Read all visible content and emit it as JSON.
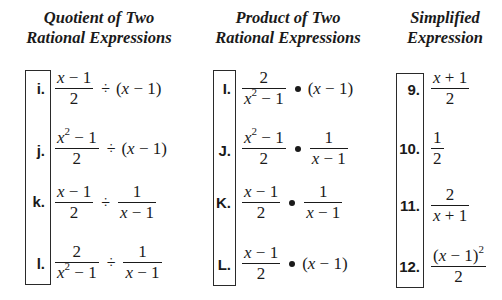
{
  "columns": [
    {
      "heading_line1": "Quotient of Two",
      "heading_line2": "Rational Expressions",
      "items": [
        {
          "label": "i.",
          "expr": "(x − 1)/2 ÷ (x − 1)"
        },
        {
          "label": "j.",
          "expr": "(x² − 1)/2 ÷ (x − 1)"
        },
        {
          "label": "k.",
          "expr": "(x − 1)/2 ÷ 1/(x − 1)"
        },
        {
          "label": "l.",
          "expr": "2/(x² − 1) ÷ 1/(x − 1)"
        }
      ]
    },
    {
      "heading_line1": "Product of Two",
      "heading_line2": "Rational Expressions",
      "items": [
        {
          "label": "I.",
          "expr": "2/(x² − 1) • (x − 1)"
        },
        {
          "label": "J.",
          "expr": "(x² − 1)/2 • 1/(x − 1)"
        },
        {
          "label": "K.",
          "expr": "(x − 1)/2 • 1/(x − 1)"
        },
        {
          "label": "L.",
          "expr": "(x − 1)/2 • (x − 1)"
        }
      ]
    },
    {
      "heading_line1": "Simplified",
      "heading_line2": "Expression",
      "items": [
        {
          "label": "9.",
          "expr": "(x + 1)/2"
        },
        {
          "label": "10.",
          "expr": "1/2"
        },
        {
          "label": "11.",
          "expr": "2/(x + 1)"
        },
        {
          "label": "12.",
          "expr": "(x − 1)²/2"
        }
      ]
    }
  ],
  "tokens": {
    "x": "x",
    "minus": "−",
    "plus": "+",
    "one": "1",
    "two": "2",
    "sq": "2",
    "div": "÷",
    "lp": "(",
    "rp": ")"
  }
}
